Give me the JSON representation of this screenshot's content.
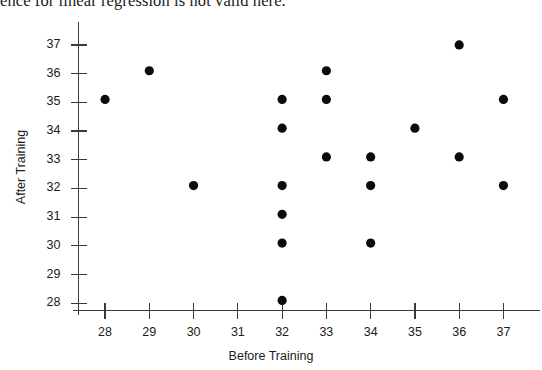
{
  "page": {
    "text_fragment": "ence for linear regression is not valid here."
  },
  "chart_data": {
    "type": "scatter",
    "title": "",
    "xlabel": "Before Training",
    "ylabel": "After Training",
    "xlim": [
      27.4,
      37.6
    ],
    "ylim": [
      27.75,
      37.45
    ],
    "grid": false,
    "legend": null,
    "x_ticks": [
      28,
      29,
      30,
      31,
      32,
      33,
      34,
      35,
      36,
      37
    ],
    "y_ticks": [
      28,
      29,
      30,
      31,
      32,
      33,
      34,
      35,
      36,
      37
    ],
    "x_tick_labels": [
      "28",
      "29",
      "30",
      "31",
      "32",
      "33",
      "34",
      "35",
      "36",
      "37"
    ],
    "y_tick_labels": [
      "28",
      "29",
      "30",
      "31",
      "32",
      "33",
      "34",
      "35",
      "36",
      "37"
    ],
    "marker": "filled-circle",
    "marker_color": "#0b0b0b",
    "marker_size_px": 4.6,
    "points": [
      {
        "x": 28,
        "y": 35.1
      },
      {
        "x": 29,
        "y": 36.1
      },
      {
        "x": 30,
        "y": 32.1
      },
      {
        "x": 32,
        "y": 35.1
      },
      {
        "x": 32,
        "y": 34.1
      },
      {
        "x": 32,
        "y": 32.1
      },
      {
        "x": 32,
        "y": 31.1
      },
      {
        "x": 32,
        "y": 30.1
      },
      {
        "x": 32,
        "y": 28.1
      },
      {
        "x": 33,
        "y": 36.1
      },
      {
        "x": 33,
        "y": 35.1
      },
      {
        "x": 33,
        "y": 33.1
      },
      {
        "x": 34,
        "y": 33.1
      },
      {
        "x": 34,
        "y": 32.1
      },
      {
        "x": 34,
        "y": 30.1
      },
      {
        "x": 35,
        "y": 34.1
      },
      {
        "x": 36,
        "y": 37.0
      },
      {
        "x": 36,
        "y": 33.1
      },
      {
        "x": 37,
        "y": 35.1
      },
      {
        "x": 37,
        "y": 32.1
      }
    ]
  }
}
